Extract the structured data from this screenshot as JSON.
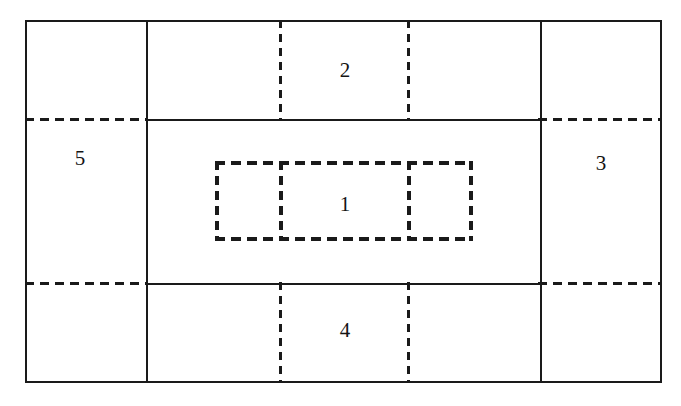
{
  "figure": {
    "type": "schematic-rectangle-partition",
    "background_color": "#ffffff",
    "line_color": "#1a1a1a",
    "canvas": {
      "width": 681,
      "height": 406
    }
  },
  "outer_frame": {
    "name": "outer-boundary",
    "style": "solid",
    "x": 25,
    "y": 20,
    "width": 637,
    "height": 363
  },
  "solid_lines": [
    {
      "name": "vertical-left-divider",
      "orientation": "vertical",
      "x": 146,
      "y1": 20,
      "y2": 383
    },
    {
      "name": "vertical-right-divider",
      "orientation": "vertical",
      "x": 540,
      "y1": 20,
      "y2": 383
    },
    {
      "name": "horizontal-upper-divider",
      "orientation": "horizontal",
      "y": 119,
      "x1": 146,
      "x2": 540
    },
    {
      "name": "horizontal-lower-divider",
      "orientation": "horizontal",
      "y": 283,
      "x1": 146,
      "x2": 540
    }
  ],
  "dashed_lines": [
    {
      "name": "dashed-horizontal-upper-left",
      "orientation": "horizontal",
      "y": 118,
      "x1": 25,
      "x2": 148
    },
    {
      "name": "dashed-horizontal-lower-left",
      "orientation": "horizontal",
      "y": 282,
      "x1": 25,
      "x2": 148
    },
    {
      "name": "dashed-horizontal-upper-right",
      "orientation": "horizontal",
      "y": 118,
      "x1": 538,
      "x2": 662
    },
    {
      "name": "dashed-horizontal-lower-right",
      "orientation": "horizontal",
      "y": 282,
      "x1": 538,
      "x2": 662
    },
    {
      "name": "dashed-vertical-top-left",
      "orientation": "vertical",
      "x": 279,
      "y1": 20,
      "y2": 121
    },
    {
      "name": "dashed-vertical-top-right",
      "orientation": "vertical",
      "x": 407,
      "y1": 20,
      "y2": 121
    },
    {
      "name": "dashed-vertical-bottom-left",
      "orientation": "vertical",
      "x": 279,
      "y1": 282,
      "y2": 383
    },
    {
      "name": "dashed-vertical-bottom-right",
      "orientation": "vertical",
      "x": 407,
      "y1": 282,
      "y2": 383
    }
  ],
  "inner_rect": {
    "name": "inner-dashed-region",
    "style": "dashed",
    "x": 215,
    "y": 161,
    "width": 258,
    "height": 80,
    "dividers": [
      {
        "name": "inner-dashed-divider-left",
        "x": 279
      },
      {
        "name": "inner-dashed-divider-right",
        "x": 407
      }
    ]
  },
  "labels": [
    {
      "id": "label-1",
      "text": "1",
      "x": 345,
      "y": 204,
      "region": "inner-center"
    },
    {
      "id": "label-2",
      "text": "2",
      "x": 345,
      "y": 70,
      "region": "top-band"
    },
    {
      "id": "label-3",
      "text": "3",
      "x": 601,
      "y": 163,
      "region": "right-band"
    },
    {
      "id": "label-4",
      "text": "4",
      "x": 345,
      "y": 330,
      "region": "bottom-band"
    },
    {
      "id": "label-5",
      "text": "5",
      "x": 80,
      "y": 158,
      "region": "left-band"
    }
  ]
}
